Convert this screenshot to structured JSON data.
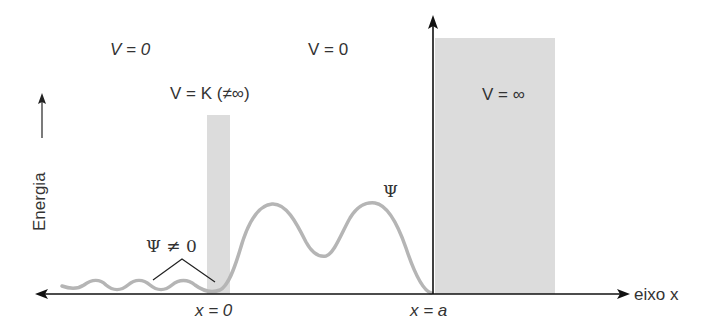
{
  "labels": {
    "v_left": "V = 0",
    "v_middle": "V = 0",
    "v_barrier": "V = K (≠∞)",
    "v_wall": "V = ∞",
    "energy_axis": "Energia",
    "psi_nonzero": "Ψ ≠ 0",
    "psi": "Ψ",
    "x_zero": "x = 0",
    "x_a": "x = a",
    "x_axis": "eixo x"
  },
  "colors": {
    "axis": "#111111",
    "region_fill": "#dcdcdc",
    "wavefunction": "#b5b5b5",
    "text": "#333333"
  }
}
